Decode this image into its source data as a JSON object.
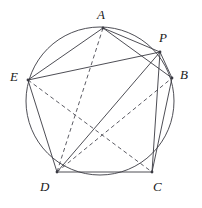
{
  "figure": {
    "width": 202,
    "height": 208,
    "stroke_color": "#3a3a42",
    "dash_color": "#4a4a52",
    "circle_color": "#3a3a42",
    "background": "#ffffff"
  },
  "circle": {
    "cx": 100,
    "cy": 101,
    "r": 74,
    "stroke_width": 0.9
  },
  "points": {
    "A": {
      "label": "A",
      "x": 103,
      "y": 28,
      "label_x": 97,
      "label_y": 8
    },
    "P": {
      "label": "P",
      "x": 160,
      "y": 52,
      "label_x": 159,
      "label_y": 31
    },
    "B": {
      "label": "B",
      "x": 172,
      "y": 78,
      "label_x": 180,
      "label_y": 68
    },
    "C": {
      "label": "C",
      "x": 152,
      "y": 172,
      "label_x": 153,
      "label_y": 180
    },
    "D": {
      "label": "D",
      "x": 57,
      "y": 172,
      "label_x": 40,
      "label_y": 180
    },
    "E": {
      "label": "E",
      "x": 28,
      "y": 80,
      "label_x": 10,
      "label_y": 70
    }
  },
  "segments": {
    "solid": [
      {
        "name": "A-P",
        "from": "A",
        "to": "P"
      },
      {
        "name": "A-B",
        "from": "A",
        "to": "B"
      },
      {
        "name": "A-E",
        "from": "A",
        "to": "E"
      },
      {
        "name": "P-B",
        "from": "P",
        "to": "B"
      },
      {
        "name": "P-E",
        "from": "P",
        "to": "E"
      },
      {
        "name": "P-D",
        "from": "P",
        "to": "D"
      },
      {
        "name": "P-C",
        "from": "P",
        "to": "C"
      },
      {
        "name": "B-C",
        "from": "B",
        "to": "C"
      },
      {
        "name": "C-D",
        "from": "C",
        "to": "D"
      },
      {
        "name": "D-E",
        "from": "D",
        "to": "E"
      }
    ],
    "dashed": [
      {
        "name": "A-D",
        "from": "A",
        "to": "D"
      },
      {
        "name": "E-C",
        "from": "E",
        "to": "C"
      },
      {
        "name": "D-B",
        "from": "D",
        "to": "B"
      }
    ]
  },
  "style": {
    "dash_pattern": "4,3",
    "line_width": 0.9,
    "vertex_dot_radius": 1.4
  }
}
